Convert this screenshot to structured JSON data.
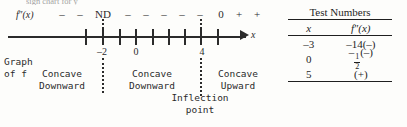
{
  "top_cut_text": "sign chart for y\"",
  "diagram": {
    "function_label": "f″(x)",
    "axis_variable": "x",
    "sign_row": [
      {
        "text": "–",
        "x": 0
      },
      {
        "text": "–",
        "x": 18
      },
      {
        "text": "ND",
        "x": 41
      },
      {
        "text": "–",
        "x": 66
      },
      {
        "text": "–",
        "x": 84
      },
      {
        "text": "–",
        "x": 102
      },
      {
        "text": "–",
        "x": 120
      },
      {
        "text": "–",
        "x": 138
      },
      {
        "text": "0",
        "x": 159
      },
      {
        "text": "+",
        "x": 177
      },
      {
        "text": "+",
        "x": 195
      }
    ],
    "tick_positions": [
      85,
      102,
      119,
      135,
      152,
      168,
      184,
      200,
      217
    ],
    "tick_labels": [
      {
        "text": "–2",
        "x": 102
      },
      {
        "text": "0",
        "x": 135
      },
      {
        "text": "4",
        "x": 201
      }
    ],
    "critical_lines": [
      {
        "label": "–2",
        "x": 102
      },
      {
        "label": "4",
        "x": 200
      }
    ],
    "graph_of_label_line1": "Graph",
    "graph_of_label_line2": "of f",
    "regions": [
      {
        "line1": "Concave",
        "line2": "Downward",
        "x": 62
      },
      {
        "line1": "Concave",
        "line2": "Downward",
        "x": 152
      },
      {
        "line1": "Concave",
        "line2": "Upward",
        "x": 238
      }
    ],
    "inflection_line1": "Inflection",
    "inflection_line2": "point",
    "inflection_x": 200
  },
  "test_numbers": {
    "title": "Test Numbers",
    "columns": [
      "x",
      "f″(x)"
    ],
    "rows": [
      {
        "x": "–3",
        "value": "–14(–)"
      },
      {
        "x": "0",
        "value_prefix": "–",
        "fraction_num": "1",
        "fraction_den": "2",
        "value_suffix": "(–)"
      },
      {
        "x": "5",
        "value": "(+)"
      }
    ]
  }
}
